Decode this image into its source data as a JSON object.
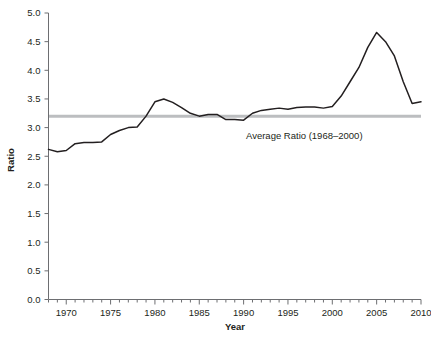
{
  "chart_data": {
    "type": "line",
    "title": "",
    "xlabel": "Year",
    "ylabel": "Ratio",
    "xlim": [
      1968,
      2010
    ],
    "ylim": [
      0.0,
      5.0
    ],
    "grid": false,
    "legend": "none",
    "x_ticks": [
      1970,
      1975,
      1980,
      1985,
      1990,
      1995,
      2000,
      2005,
      2010
    ],
    "x_minor_tick_step": 1,
    "y_ticks": [
      0.0,
      0.5,
      1.0,
      1.5,
      2.0,
      2.5,
      3.0,
      3.5,
      4.0,
      4.5,
      5.0
    ],
    "y_tick_labels": [
      "0.0",
      "0.5",
      "1.0",
      "1.5",
      "2.0",
      "2.5",
      "3.0",
      "3.5",
      "4.0",
      "4.5",
      "5.0"
    ],
    "series": [
      {
        "name": "Ratio",
        "color": "#231f20",
        "x": [
          1968,
          1969,
          1970,
          1971,
          1972,
          1973,
          1974,
          1975,
          1976,
          1977,
          1978,
          1979,
          1980,
          1981,
          1982,
          1983,
          1984,
          1985,
          1986,
          1987,
          1988,
          1989,
          1990,
          1991,
          1992,
          1993,
          1994,
          1995,
          1996,
          1997,
          1998,
          1999,
          2000,
          2001,
          2002,
          2003,
          2004,
          2005,
          2006,
          2007,
          2008,
          2009,
          2010
        ],
        "values": [
          2.62,
          2.58,
          2.6,
          2.72,
          2.74,
          2.74,
          2.75,
          2.88,
          2.95,
          3.0,
          3.01,
          3.2,
          3.45,
          3.5,
          3.44,
          3.35,
          3.25,
          3.2,
          3.23,
          3.23,
          3.14,
          3.14,
          3.13,
          3.25,
          3.3,
          3.32,
          3.34,
          3.32,
          3.35,
          3.36,
          3.36,
          3.34,
          3.37,
          3.55,
          3.8,
          4.05,
          4.4,
          4.66,
          4.5,
          4.25,
          3.8,
          3.42,
          3.45
        ]
      }
    ],
    "reference_line": {
      "label": "Average Ratio (1968–2000)",
      "value": 3.2,
      "color": "#bcbec0",
      "period": "1968–2000"
    }
  },
  "axes": {
    "spine_color": "#6d6e71"
  }
}
